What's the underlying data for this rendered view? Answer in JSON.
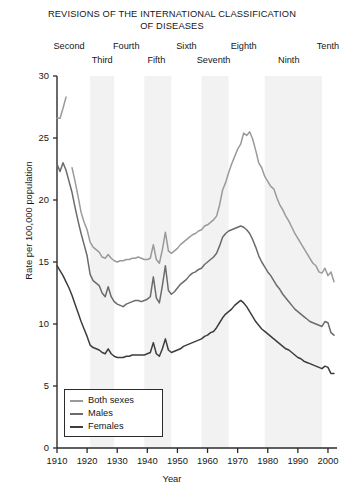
{
  "chart_data": {
    "type": "line",
    "title": "REVISIONS OF THE INTERNATIONAL CLASSIFICATION OF DISEASES",
    "title_line1": "REVISIONS OF THE INTERNATIONAL CLASSIFICATION",
    "title_line2": "OF DISEASES",
    "xlabel": "Year",
    "ylabel": "Rate per 100,000 population",
    "xlim": [
      1910,
      2003
    ],
    "ylim": [
      0,
      30
    ],
    "yticks": [
      0,
      5,
      10,
      15,
      20,
      25,
      30
    ],
    "xticks": [
      1910,
      1920,
      1930,
      1940,
      1950,
      1960,
      1970,
      1980,
      1990,
      2000
    ],
    "grid": false,
    "legend_position": "bottom-left",
    "legend": [
      "Both sexes",
      "Males",
      "Females"
    ],
    "colors": {
      "both_sexes": "#9a9a9a",
      "males": "#6b6b6b",
      "females": "#3d3d3d",
      "band": "#f2f2f2",
      "axis": "#2b2b2b"
    },
    "revision_bands": [
      {
        "label": "Second",
        "start": 1910,
        "end": 1920,
        "shaded": false
      },
      {
        "label": "Third",
        "start": 1921,
        "end": 1929,
        "shaded": true
      },
      {
        "label": "Fourth",
        "start": 1930,
        "end": 1938,
        "shaded": false
      },
      {
        "label": "Fifth",
        "start": 1939,
        "end": 1948,
        "shaded": true
      },
      {
        "label": "Sixth",
        "start": 1949,
        "end": 1957,
        "shaded": false
      },
      {
        "label": "Seventh",
        "start": 1958,
        "end": 1967,
        "shaded": true
      },
      {
        "label": "Eighth",
        "start": 1968,
        "end": 1978,
        "shaded": false
      },
      {
        "label": "Ninth",
        "start": 1979,
        "end": 1998,
        "shaded": true
      },
      {
        "label": "Tenth",
        "start": 1999,
        "end": 2003,
        "shaded": false
      }
    ],
    "revision_labels_top": [
      {
        "text": "Second",
        "x": 1914
      },
      {
        "text": "Fourth",
        "x": 1933
      },
      {
        "text": "Sixth",
        "x": 1953
      },
      {
        "text": "Eighth",
        "x": 1972
      },
      {
        "text": "Tenth",
        "x": 2000
      }
    ],
    "revision_labels_bottom": [
      {
        "text": "Third",
        "x": 1925
      },
      {
        "text": "Fifth",
        "x": 1943
      },
      {
        "text": "Seventh",
        "x": 1962
      },
      {
        "text": "Ninth",
        "x": 1987
      }
    ],
    "series": [
      {
        "name": "Both sexes",
        "color": "#9a9a9a",
        "segments": [
          {
            "x": [
              1910,
              1911,
              1912,
              1913
            ],
            "values": [
              26.6,
              26.6,
              27.4,
              28.3
            ]
          },
          {
            "x": [
              1915,
              1916,
              1917,
              1918,
              1919,
              1920,
              1921,
              1922,
              1923,
              1924,
              1925,
              1926,
              1927,
              1928,
              1929,
              1930,
              1931,
              1932,
              1933,
              1934,
              1935,
              1936,
              1937,
              1938,
              1939,
              1940,
              1941,
              1942,
              1943,
              1944,
              1945,
              1946,
              1947,
              1948,
              1949,
              1950,
              1951,
              1952,
              1953,
              1954,
              1955,
              1956,
              1957,
              1958,
              1959,
              1960,
              1961,
              1962,
              1963,
              1964,
              1965,
              1966,
              1967,
              1968,
              1969,
              1970,
              1971,
              1972,
              1973,
              1974,
              1975,
              1976,
              1977,
              1978,
              1979,
              1980,
              1981,
              1982,
              1983,
              1984,
              1985,
              1986,
              1987,
              1988,
              1989,
              1990,
              1991,
              1992,
              1993,
              1994,
              1995,
              1996,
              1997,
              1998,
              1999,
              2000,
              2001,
              2002
            ],
            "values": [
              22.6,
              21.5,
              20.3,
              19.0,
              18.2,
              17.6,
              16.6,
              16.2,
              16.0,
              15.8,
              15.4,
              15.3,
              15.6,
              15.3,
              15.1,
              15.0,
              15.1,
              15.1,
              15.2,
              15.2,
              15.3,
              15.3,
              15.4,
              15.3,
              15.2,
              15.2,
              15.3,
              16.4,
              15.2,
              14.9,
              16.0,
              17.4,
              15.9,
              15.7,
              15.9,
              16.1,
              16.4,
              16.6,
              16.8,
              17.0,
              17.2,
              17.3,
              17.5,
              17.6,
              17.9,
              18.0,
              18.2,
              18.4,
              18.7,
              19.6,
              20.8,
              21.4,
              22.2,
              22.9,
              23.5,
              24.1,
              24.5,
              25.4,
              25.2,
              25.5,
              24.9,
              24.0,
              23.0,
              22.6,
              21.9,
              21.5,
              21.1,
              20.9,
              20.2,
              19.6,
              19.2,
              18.7,
              18.3,
              17.8,
              17.3,
              16.9,
              16.5,
              16.1,
              15.7,
              15.3,
              14.9,
              14.7,
              14.2,
              14.1,
              14.5,
              13.9,
              14.2,
              13.4,
              13.0,
              12.8,
              12.9,
              12.4
            ]
          }
        ]
      },
      {
        "name": "Males",
        "color": "#6b6b6b",
        "x": [
          1910,
          1911,
          1912,
          1913,
          1914,
          1915,
          1916,
          1917,
          1918,
          1919,
          1920,
          1921,
          1922,
          1923,
          1924,
          1925,
          1926,
          1927,
          1928,
          1929,
          1930,
          1931,
          1932,
          1933,
          1934,
          1935,
          1936,
          1937,
          1938,
          1939,
          1940,
          1941,
          1942,
          1943,
          1944,
          1945,
          1946,
          1947,
          1948,
          1949,
          1950,
          1951,
          1952,
          1953,
          1954,
          1955,
          1956,
          1957,
          1958,
          1959,
          1960,
          1961,
          1962,
          1963,
          1964,
          1965,
          1966,
          1967,
          1968,
          1969,
          1970,
          1971,
          1972,
          1973,
          1974,
          1975,
          1976,
          1977,
          1978,
          1979,
          1980,
          1981,
          1982,
          1983,
          1984,
          1985,
          1986,
          1987,
          1988,
          1989,
          1990,
          1991,
          1992,
          1993,
          1994,
          1995,
          1996,
          1997,
          1998,
          1999,
          2000,
          2001,
          2002
        ],
        "values": [
          22.9,
          22.3,
          23.0,
          22.4,
          21.5,
          20.6,
          19.4,
          18.3,
          17.3,
          16.4,
          15.5,
          14.0,
          13.5,
          13.3,
          13.1,
          12.5,
          12.2,
          13.0,
          12.2,
          11.8,
          11.6,
          11.5,
          11.4,
          11.6,
          11.7,
          11.8,
          11.9,
          11.9,
          11.8,
          11.9,
          12.0,
          12.2,
          13.8,
          12.1,
          11.7,
          13.1,
          14.7,
          12.7,
          12.4,
          12.6,
          12.9,
          13.2,
          13.4,
          13.6,
          13.9,
          14.1,
          14.2,
          14.4,
          14.5,
          14.8,
          15.0,
          15.2,
          15.4,
          15.7,
          16.3,
          17.0,
          17.3,
          17.5,
          17.6,
          17.7,
          17.8,
          17.9,
          17.8,
          17.6,
          17.3,
          16.8,
          16.2,
          15.5,
          15.0,
          14.6,
          14.2,
          13.9,
          13.5,
          13.1,
          12.8,
          12.4,
          12.1,
          11.8,
          11.5,
          11.2,
          11.0,
          10.8,
          10.6,
          10.4,
          10.2,
          10.1,
          10.0,
          9.9,
          9.8,
          10.2,
          10.1,
          9.3,
          9.1
        ]
      },
      {
        "name": "Females",
        "color": "#3d3d3d",
        "x": [
          1910,
          1911,
          1912,
          1913,
          1914,
          1915,
          1916,
          1917,
          1918,
          1919,
          1920,
          1921,
          1922,
          1923,
          1924,
          1925,
          1926,
          1927,
          1928,
          1929,
          1930,
          1931,
          1932,
          1933,
          1934,
          1935,
          1936,
          1937,
          1938,
          1939,
          1940,
          1941,
          1942,
          1943,
          1944,
          1945,
          1946,
          1947,
          1948,
          1949,
          1950,
          1951,
          1952,
          1953,
          1954,
          1955,
          1956,
          1957,
          1958,
          1959,
          1960,
          1961,
          1962,
          1963,
          1964,
          1965,
          1966,
          1967,
          1968,
          1969,
          1970,
          1971,
          1972,
          1973,
          1974,
          1975,
          1976,
          1977,
          1978,
          1979,
          1980,
          1981,
          1982,
          1983,
          1984,
          1985,
          1986,
          1987,
          1988,
          1989,
          1990,
          1991,
          1992,
          1993,
          1994,
          1995,
          1996,
          1997,
          1998,
          1999,
          2000,
          2001,
          2002
        ],
        "values": [
          14.7,
          14.3,
          13.9,
          13.4,
          12.9,
          12.3,
          11.6,
          10.9,
          10.2,
          9.6,
          9.0,
          8.3,
          8.1,
          8.0,
          7.9,
          7.7,
          7.6,
          8.0,
          7.6,
          7.4,
          7.3,
          7.3,
          7.3,
          7.4,
          7.4,
          7.5,
          7.5,
          7.5,
          7.5,
          7.5,
          7.6,
          7.7,
          8.5,
          7.6,
          7.4,
          8.0,
          8.8,
          7.9,
          7.7,
          7.8,
          7.9,
          8.0,
          8.2,
          8.3,
          8.4,
          8.5,
          8.6,
          8.7,
          8.8,
          9.0,
          9.1,
          9.3,
          9.4,
          9.7,
          10.1,
          10.5,
          10.8,
          11.0,
          11.2,
          11.5,
          11.7,
          11.9,
          11.7,
          11.4,
          11.0,
          10.6,
          10.2,
          9.9,
          9.6,
          9.4,
          9.2,
          9.0,
          8.8,
          8.6,
          8.4,
          8.2,
          8.0,
          7.9,
          7.7,
          7.5,
          7.3,
          7.2,
          7.0,
          6.9,
          6.8,
          6.7,
          6.6,
          6.5,
          6.4,
          6.6,
          6.5,
          6.0,
          6.0
        ]
      }
    ]
  },
  "caption": {
    "text": ""
  }
}
